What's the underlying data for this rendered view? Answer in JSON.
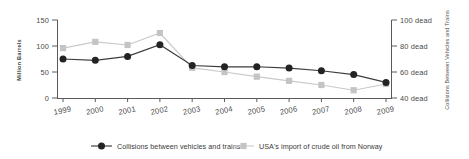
{
  "chart_data": {
    "type": "line",
    "title": "",
    "subtitle": "",
    "xlabel": "",
    "categories": [
      "1999",
      "2000",
      "2001",
      "2002",
      "2003",
      "2004",
      "2005",
      "2006",
      "2007",
      "2008",
      "2009"
    ],
    "grid": false,
    "legend_position": "bottom",
    "axes": {
      "left": {
        "label": "Million Barrels",
        "ticks": [
          0,
          50,
          100,
          150
        ],
        "tick_labels": [
          "0",
          "50",
          "100",
          "150"
        ],
        "lim": [
          0,
          150
        ]
      },
      "right": {
        "label": "Collisions Between Vehicles and Trains",
        "ticks": [
          40,
          60,
          80,
          100
        ],
        "tick_labels": [
          "40 dead",
          "60 dead",
          "80 dead",
          "100 dead"
        ],
        "lim": [
          40,
          100
        ]
      }
    },
    "series": [
      {
        "name": "Collisions between vehicles and trains",
        "axis": "right",
        "color": "#232323",
        "line_color": "#3c3c3c",
        "marker": "circle",
        "values": [
          70,
          69,
          72,
          81,
          65,
          64,
          64,
          63,
          61,
          58,
          52
        ]
      },
      {
        "name": "USA's import of crude oil from Norway",
        "axis": "left",
        "color": "#c4c4c4",
        "line_color": "#c9c9c9",
        "marker": "square",
        "values": [
          96,
          108,
          102,
          125,
          58,
          50,
          41,
          33,
          25,
          15,
          27
        ]
      }
    ]
  },
  "legend": {
    "items": [
      {
        "label": "Collisions between vehicles and trains",
        "marker": "circle",
        "color": "#232323"
      },
      {
        "label": "USA's import of crude oil from Norway",
        "marker": "square",
        "color": "#c4c4c4"
      }
    ]
  }
}
